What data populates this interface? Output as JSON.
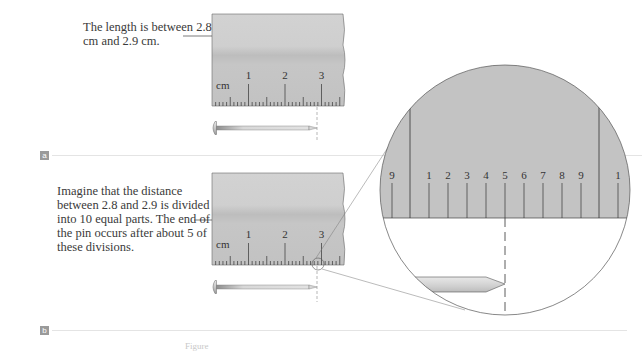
{
  "figure": {
    "panel_a": {
      "badge": "a",
      "caption": "The length is between 2.8 cm and 2.9 cm.",
      "ruler": {
        "unit_label": "cm",
        "major_labels": [
          "1",
          "2",
          "3"
        ]
      },
      "pin_end_cm": 2.85
    },
    "panel_b": {
      "badge": "b",
      "caption": "Imagine that the distance between 2.8 and 2.9 is divided into 10 equal parts. The end of the pin occurs after about 5 of these divisions.",
      "ruler": {
        "unit_label": "cm",
        "major_labels": [
          "1",
          "2",
          "3"
        ]
      },
      "magnified_view": {
        "labels": [
          "9",
          "1",
          "2",
          "3",
          "4",
          "5",
          "6",
          "7",
          "8",
          "9",
          "1"
        ],
        "pin_end_division": 5
      }
    },
    "footer_fragment": "Figure"
  },
  "colors": {
    "ruler_gray": "#c9c9c9",
    "ruler_dark_band": "#bdbdbd",
    "tick": "#333333",
    "separator": "#e4e4e4",
    "badge": "#9a9a9a"
  }
}
